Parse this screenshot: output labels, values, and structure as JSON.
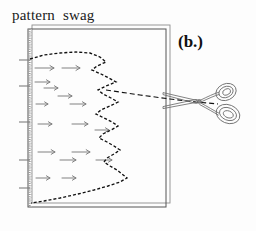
{
  "figure": {
    "title": "pattern  swag",
    "panel_label": "(b.)",
    "background_color": "#fdfdfd",
    "ink_color": "#1a1a1a",
    "fold_color": "#9a9a9a",
    "light_ink_color": "#6b6b6b"
  },
  "paper": {
    "front_sheet": {
      "x": 28,
      "y": 29,
      "width": 138,
      "height": 178,
      "stroke": "#555555"
    },
    "back_sheet": {
      "x": 32,
      "y": 25,
      "width": 138,
      "height": 178,
      "stroke": "#8d8d8d"
    },
    "fold_edge": {
      "x": 29,
      "y": 29,
      "height": 178,
      "stroke": "#9a9a9a",
      "style": "dotted-textured"
    }
  },
  "pattern_curve": {
    "label": "swag-pattern-outline",
    "style": "dashed",
    "stroke": "#111111",
    "dash": "3 2",
    "points": "30,59 44,55 60,53 76,52 90,53 100,57 106,62 97,66 92,70 101,74 109,78 116,82 106,86 98,90 103,94 111,98 118,102 110,106 101,110 96,114 104,118 112,122 118,126 111,130 103,134 99,138 107,142 114,146 120,150 114,154 107,158 104,162 110,166 117,170 122,174 127,178 120,182 108,186 94,190 78,194 60,198 44,201 31,203"
  },
  "cut_line": {
    "label": "scissor-cut-guide",
    "style": "dashed",
    "stroke": "#111111",
    "dash": "5 3",
    "points": "106,90 140,95 170,99 196,102 218,104"
  },
  "hatch_arrows": {
    "label": "fabric-direction-arrows",
    "stroke": "#7a7a7a",
    "rows": [
      {
        "y": 68,
        "arrows": [
          {
            "x1": 35,
            "x2": 54
          },
          {
            "x1": 62,
            "x2": 80
          }
        ]
      },
      {
        "y": 82,
        "arrows": [
          {
            "x1": 35,
            "x2": 50
          }
        ]
      },
      {
        "y": 88,
        "arrows": [
          {
            "x1": 44,
            "x2": 58
          }
        ]
      },
      {
        "y": 96,
        "arrows": [
          {
            "x1": 58,
            "x2": 72
          }
        ]
      },
      {
        "y": 104,
        "arrows": [
          {
            "x1": 36,
            "x2": 48
          },
          {
            "x1": 70,
            "x2": 86
          }
        ]
      },
      {
        "y": 124,
        "arrows": [
          {
            "x1": 38,
            "x2": 52
          },
          {
            "x1": 72,
            "x2": 88
          }
        ]
      },
      {
        "y": 130,
        "arrows": [
          {
            "x1": 95,
            "x2": 109
          }
        ]
      },
      {
        "y": 152,
        "arrows": [
          {
            "x1": 38,
            "x2": 55
          },
          {
            "x1": 72,
            "x2": 90
          }
        ]
      },
      {
        "y": 160,
        "arrows": [
          {
            "x1": 60,
            "x2": 76
          },
          {
            "x1": 96,
            "x2": 112
          }
        ]
      },
      {
        "y": 178,
        "arrows": [
          {
            "x1": 36,
            "x2": 50
          },
          {
            "x1": 62,
            "x2": 76
          }
        ]
      }
    ]
  },
  "fold_ticks": {
    "label": "fold-edge-tick-marks",
    "stroke": "#7f7f7f",
    "y_positions": [
      60,
      86,
      122,
      160,
      188
    ],
    "length": 11
  },
  "scissors": {
    "label": "scissors-icon",
    "stroke": "#6d6d6d",
    "pivot": {
      "x": 199,
      "y": 101
    },
    "blades": [
      {
        "name": "upper-blade",
        "tip_x": 163,
        "tip_y": 93
      },
      {
        "name": "lower-blade",
        "tip_x": 163,
        "tip_y": 108
      }
    ],
    "handles": [
      {
        "name": "upper-handle-loop",
        "cx": 226,
        "cy": 92,
        "rx": 10,
        "ry": 8,
        "rotate": -25
      },
      {
        "name": "lower-handle-loop",
        "cx": 228,
        "cy": 114,
        "rx": 12,
        "ry": 9,
        "rotate": 22
      }
    ]
  }
}
